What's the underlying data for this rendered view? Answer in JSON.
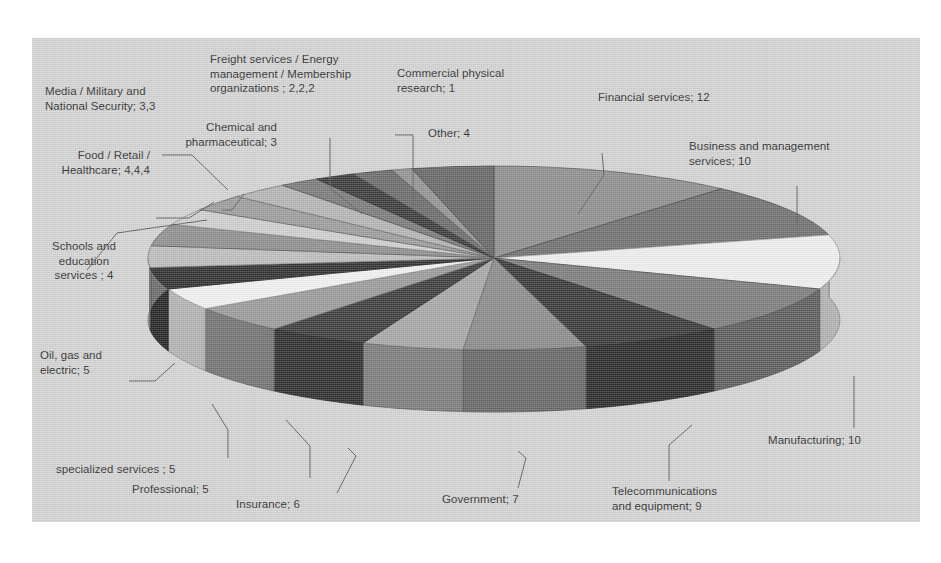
{
  "chart_data": {
    "type": "pie",
    "title": "",
    "subtitle": "",
    "xlabel": "",
    "ylabel": "",
    "grid": false,
    "legend_position": "none",
    "label_format": "category; value",
    "three_d": true,
    "total": 100,
    "categories": [
      "Financial services",
      "Business and management services",
      "Manufacturing",
      "Telecommunications and equipment",
      "Government",
      "Insurance",
      "Professional",
      "specialized services",
      "Oil, gas and electric",
      "Schools and education services",
      "Food",
      "Retail",
      "Healthcare",
      "Media",
      "Military and National Security",
      "Chemical and pharmaceutical",
      "Freight services",
      "Energy management",
      "Membership organizations",
      "Commercial physical research",
      "Other"
    ],
    "values": [
      12,
      10,
      10,
      9,
      7,
      6,
      5,
      5,
      5,
      4,
      4,
      4,
      4,
      3,
      3,
      3,
      2,
      2,
      2,
      1,
      4
    ],
    "slice_colors": [
      "#8e8e8e",
      "#6f6f6f",
      "#efefef",
      "#7c7c7c",
      "#383838",
      "#8a8a8a",
      "#a6a6a6",
      "#3b3b3b",
      "#9a9a9a",
      "#f2f2f2",
      "#2f2f2f",
      "#bdbdbd",
      "#8f8f8f",
      "#cfcfcf",
      "#9c9c9c",
      "#b4b4b4",
      "#7a7a7a",
      "#3a3a3a",
      "#6a6a6a",
      "#929292",
      "#666666"
    ]
  },
  "labels": [
    {
      "name": "media-military-label",
      "text": "Media / Military and\nNational Security; 3,3"
    },
    {
      "name": "freight-energy-label",
      "text": "Freight services / Energy\nmanagement / Membership\norganizations ; 2,2,2"
    },
    {
      "name": "commercial-research-label",
      "text": "Commercial physical\nresearch; 1"
    },
    {
      "name": "financial-services-label",
      "text": "Financial services; 12"
    },
    {
      "name": "chemical-pharma-label",
      "text": "Chemical and\npharmaceutical; 3"
    },
    {
      "name": "other-label",
      "text": "Other; 4"
    },
    {
      "name": "business-management-label",
      "text": "Business and management\nservices; 10"
    },
    {
      "name": "food-retail-health-label",
      "text": "Food / Retail /\nHealthcare; 4,4,4"
    },
    {
      "name": "schools-education-label",
      "text": "Schools and\neducation\nservices ; 4"
    },
    {
      "name": "oil-gas-electric-label",
      "text": "Oil, gas and\nelectric; 5"
    },
    {
      "name": "manufacturing-label",
      "text": "Manufacturing; 10"
    },
    {
      "name": "specialized-services-label",
      "text": "specialized services ; 5"
    },
    {
      "name": "professional-label",
      "text": "Professional; 5"
    },
    {
      "name": "insurance-label",
      "text": "Insurance; 6"
    },
    {
      "name": "government-label",
      "text": "Government; 7"
    },
    {
      "name": "telecom-label",
      "text": "Telecommunications\nand equipment; 9"
    }
  ],
  "colors": {
    "plate_background": "#d4d4d4",
    "page_background": "#ffffff",
    "label_text": "#2b2b2b",
    "leader_line": "#5c5c5c"
  }
}
